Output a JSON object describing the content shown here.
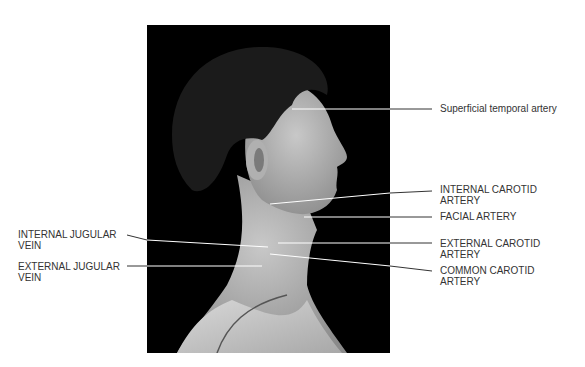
{
  "figure": {
    "background_color": "#ffffff",
    "photo_background": "#000000"
  },
  "labels": {
    "superficial_temporal": {
      "line1": "Superficial temporal artery"
    },
    "internal_carotid": {
      "line1": "INTERNAL CAROTID",
      "line2": "ARTERY"
    },
    "facial": {
      "line1": "FACIAL ARTERY"
    },
    "external_carotid": {
      "line1": "EXTERNAL CAROTID",
      "line2": "ARTERY"
    },
    "common_carotid": {
      "line1": "COMMON CAROTID",
      "line2": "ARTERY"
    },
    "internal_jugular": {
      "line1": "INTERNAL JUGULAR",
      "line2": "VEIN"
    },
    "external_jugular": {
      "line1": "EXTERNAL JUGULAR",
      "line2": "VEIN"
    }
  }
}
